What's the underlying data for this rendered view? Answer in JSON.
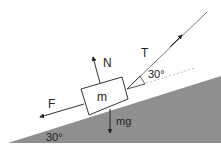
{
  "diagram": {
    "labels": {
      "mass": "m",
      "normal": "N",
      "tension": "T",
      "friction": "F",
      "weight": "mg",
      "tension_angle": "30°",
      "incline_angle": "30°"
    },
    "colors": {
      "incline_fill": "#8f8f8f",
      "line": "#333333",
      "dotted": "#aaaaaa"
    }
  }
}
